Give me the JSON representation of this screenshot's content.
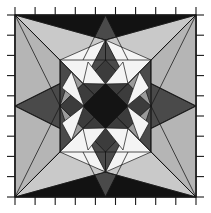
{
  "figure": {
    "title": "",
    "width": 211,
    "height": 213,
    "background": "#ffffff",
    "plot_area": {
      "x": 14,
      "y": 14,
      "width": 183,
      "height": 184
    },
    "frame": {
      "stroke": "#1a1a1a",
      "stroke_width": 1.2
    },
    "ticks": {
      "direction": "outward",
      "length": 6,
      "stroke": "#1a1a1a",
      "stroke_width": 1.1,
      "count_per_side": 9,
      "top": [
        14,
        34.3,
        54.7,
        75,
        95.4,
        115.7,
        136.1,
        156.4,
        176.8,
        197
      ],
      "bottom": [
        14,
        34.3,
        54.7,
        75,
        95.4,
        115.7,
        136.1,
        156.4,
        176.8,
        197
      ],
      "left": [
        14,
        34.4,
        54.9,
        75.3,
        95.8,
        116.2,
        136.7,
        157.1,
        177.6,
        198
      ],
      "right": [
        14,
        34.4,
        54.9,
        75.3,
        95.8,
        116.2,
        136.7,
        157.1,
        177.6,
        198
      ]
    },
    "palette": {
      "background_fill": "#b5b5b5",
      "white": "#f4f4f4",
      "light_gray": "#b5b5b5",
      "mid_gray": "#808080",
      "dark_gray": "#4a4a4a",
      "darker_gray": "#3a3a3a",
      "near_black": "#121212",
      "edge": "#151515"
    },
    "edge_stroke_width": 0.8,
    "geometry": {
      "symmetry": "4-fold rotational",
      "center": [
        105.5,
        106
      ],
      "corners": [
        [
          15,
          15
        ],
        [
          196,
          15
        ],
        [
          196,
          197
        ],
        [
          15,
          197
        ]
      ]
    }
  }
}
